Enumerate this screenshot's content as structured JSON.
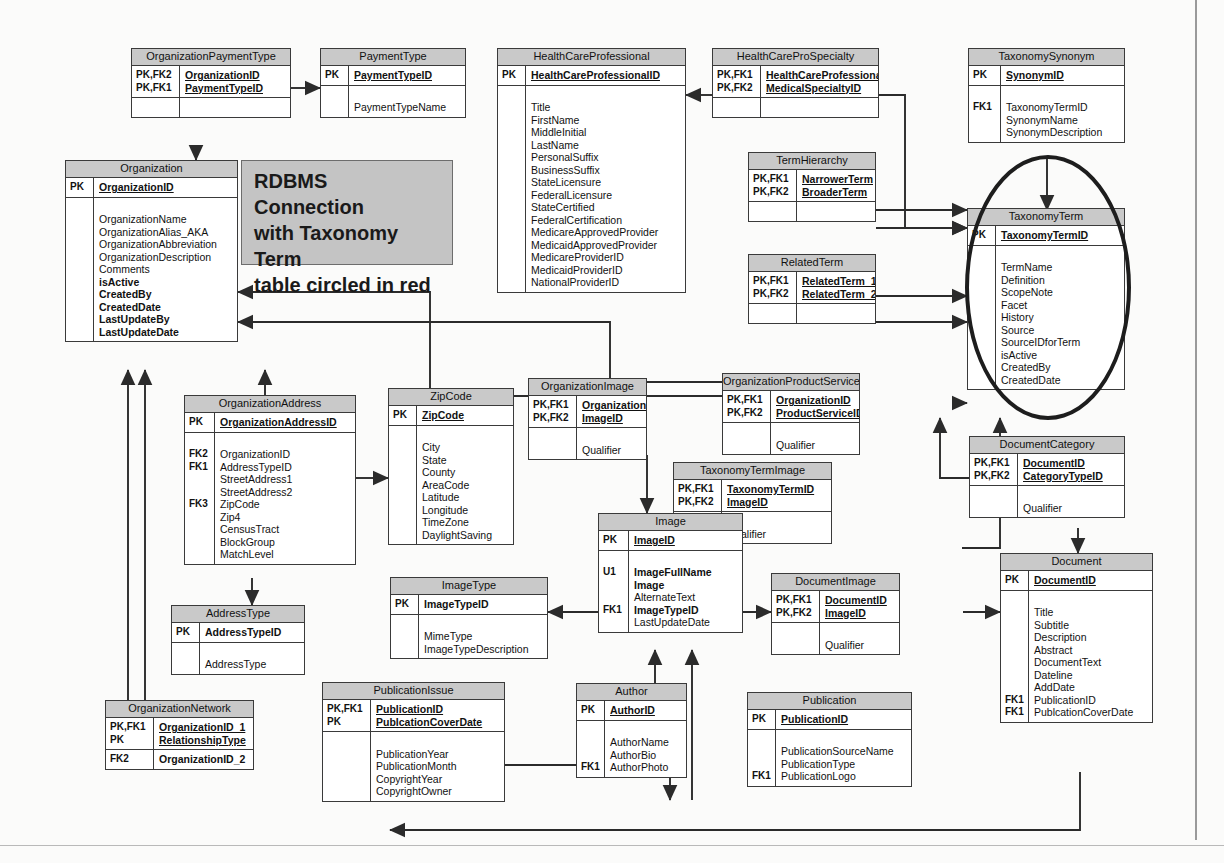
{
  "diagram": {
    "annotation": {
      "line1": "RDBMS Connection",
      "line2": "with Taxonomy Term",
      "line3": "table circled in red"
    },
    "highlight": {
      "target_table": "TaxonomyTerm",
      "shape": "ellipse",
      "color": "#cc0000",
      "rendered_color": "#1d1d1d"
    },
    "colors": {
      "table_header_fill": "#c9c9c9",
      "table_body_fill": "#ffffff",
      "table_border": "#3a3a3a",
      "connector": "#2b2b2b",
      "callout_fill": "#c4c4c4",
      "page_background": "#fbfbfa"
    },
    "tables": [
      {
        "id": "organization-payment-type",
        "name": "OrganizationPaymentType",
        "keys": [
          "PK,FK2",
          "PK,FK1"
        ],
        "pk_fields": [
          "OrganizationID",
          "PaymentTypeID"
        ],
        "attr_keys": [],
        "attributes": []
      },
      {
        "id": "payment-type",
        "name": "PaymentType",
        "keys": [
          "PK"
        ],
        "pk_fields": [
          "PaymentTypeID"
        ],
        "attr_keys": [],
        "attributes": [
          "PaymentTypeName"
        ]
      },
      {
        "id": "health-care-professional",
        "name": "HealthCareProfessional",
        "keys": [
          "PK"
        ],
        "pk_fields": [
          "HealthCareProfessionalID"
        ],
        "attr_keys": [],
        "attributes": [
          "Title",
          "FirstName",
          "MiddleInitial",
          "LastName",
          "PersonalSuffix",
          "BusinessSuffix",
          "StateLicensure",
          "FederalLicensure",
          "StateCertified",
          "FederalCertification",
          "MedicareApprovedProvider",
          "MedicaidApprovedProvider",
          "MedicareProviderID",
          "MedicaidProviderID",
          "NationalProviderID"
        ]
      },
      {
        "id": "health-care-pro-specialty",
        "name": "HealthCareProSpecialty",
        "keys": [
          "PK,FK1",
          "PK,FK2"
        ],
        "pk_fields": [
          "HealthCareProfessionalID",
          "MedicalSpecialtyID"
        ],
        "attr_keys": [],
        "attributes": []
      },
      {
        "id": "taxonomy-synonym",
        "name": "TaxonomySynonym",
        "keys": [
          "PK"
        ],
        "pk_fields": [
          "SynonymID"
        ],
        "attr_keys": [
          "FK1",
          "",
          ""
        ],
        "attributes": [
          "TaxonomyTermID",
          "SynonymName",
          "SynonymDescription"
        ]
      },
      {
        "id": "organization",
        "name": "Organization",
        "keys": [
          "PK"
        ],
        "pk_fields": [
          "OrganizationID"
        ],
        "attr_keys": [],
        "attributes": [
          "OrganizationName",
          "OrganizationAlias_AKA",
          "OrganizationAbbreviation",
          "OrganizationDescription",
          "Comments",
          "isActive",
          "CreatedBy",
          "CreatedDate",
          "LastUpdateBy",
          "LastUpdateDate"
        ],
        "bold_attributes": [
          "isActive",
          "CreatedBy",
          "CreatedDate",
          "LastUpdateBy",
          "LastUpdateDate"
        ]
      },
      {
        "id": "term-hierarchy",
        "name": "TermHierarchy",
        "keys": [
          "PK,FK1",
          "PK,FK2"
        ],
        "pk_fields": [
          "NarrowerTerm",
          "BroaderTerm"
        ],
        "attr_keys": [],
        "attributes": []
      },
      {
        "id": "related-term",
        "name": "RelatedTerm",
        "keys": [
          "PK,FK1",
          "PK,FK2"
        ],
        "pk_fields": [
          "RelatedTerm_1",
          "RelatedTerm_2"
        ],
        "attr_keys": [],
        "attributes": []
      },
      {
        "id": "taxonomy-term",
        "name": "TaxonomyTerm",
        "keys": [
          "PK"
        ],
        "pk_fields": [
          "TaxonomyTermID"
        ],
        "attr_keys": [],
        "attributes": [
          "TermName",
          "Definition",
          "ScopeNote",
          "Facet",
          "History",
          "Source",
          "SourceIDforTerm",
          "isActive",
          "CreatedBy",
          "CreatedDate"
        ]
      },
      {
        "id": "organization-address",
        "name": "OrganizationAddress",
        "keys": [
          "PK"
        ],
        "pk_fields": [
          "OrganizationAddressID"
        ],
        "attr_keys": [
          "FK2",
          "FK1",
          "",
          "",
          "FK3",
          "",
          "",
          "",
          ""
        ],
        "attributes": [
          "OrganizationID",
          "AddressTypeID",
          "StreetAddress1",
          "StreetAddress2",
          "ZipCode",
          "Zip4",
          "CensusTract",
          "BlockGroup",
          "MatchLevel"
        ]
      },
      {
        "id": "zip-code",
        "name": "ZipCode",
        "keys": [
          "PK"
        ],
        "pk_fields": [
          "ZipCode"
        ],
        "attr_keys": [],
        "attributes": [
          "City",
          "State",
          "County",
          "AreaCode",
          "Latitude",
          "Longitude",
          "TimeZone",
          "DaylightSaving"
        ]
      },
      {
        "id": "organization-image",
        "name": "OrganizationImage",
        "keys": [
          "PK,FK1",
          "PK,FK2"
        ],
        "pk_fields": [
          "OrganizationID",
          "ImageID"
        ],
        "attr_keys": [],
        "attributes": [
          "Qualifier"
        ]
      },
      {
        "id": "organization-product-service",
        "name": "OrganizationProductService",
        "keys": [
          "PK,FK1",
          "PK,FK2"
        ],
        "pk_fields": [
          "OrganizationID",
          "ProductServiceID"
        ],
        "attr_keys": [],
        "attributes": [
          "Qualifier"
        ]
      },
      {
        "id": "document-category",
        "name": "DocumentCategory",
        "keys": [
          "PK,FK1",
          "PK,FK2"
        ],
        "pk_fields": [
          "DocumentID",
          "CategoryTypeID"
        ],
        "attr_keys": [],
        "attributes": [
          "Qualifier"
        ]
      },
      {
        "id": "taxonomy-term-image",
        "name": "TaxonomyTermImage",
        "keys": [
          "PK,FK1",
          "PK,FK2"
        ],
        "pk_fields": [
          "TaxonomyTermID",
          "ImageID"
        ],
        "attr_keys": [],
        "attributes": [
          "Qualifier"
        ]
      },
      {
        "id": "image",
        "name": "Image",
        "keys": [
          "PK"
        ],
        "pk_fields": [
          "ImageID"
        ],
        "attr_keys": [
          "U1",
          "",
          "",
          "FK1",
          ""
        ],
        "attributes": [
          "ImageFullName",
          "Image",
          "AlternateText",
          "ImageTypeID",
          "LastUpdateDate"
        ],
        "bold_attributes": [
          "ImageFullName",
          "Image",
          "ImageTypeID"
        ]
      },
      {
        "id": "image-type",
        "name": "ImageType",
        "keys": [
          "PK"
        ],
        "pk_fields": [
          "ImageTypeID"
        ],
        "pk_underline": false,
        "attr_keys": [],
        "attributes": [
          "MimeType",
          "ImageTypeDescription"
        ]
      },
      {
        "id": "document-image",
        "name": "DocumentImage",
        "keys": [
          "PK,FK1",
          "PK,FK2"
        ],
        "pk_fields": [
          "DocumentID",
          "ImageID"
        ],
        "attr_keys": [],
        "attributes": [
          "Qualifier"
        ]
      },
      {
        "id": "document",
        "name": "Document",
        "keys": [
          "PK"
        ],
        "pk_fields": [
          "DocumentID"
        ],
        "attr_keys": [
          "",
          "",
          "",
          "",
          "",
          "",
          "",
          "FK1",
          "FK1"
        ],
        "attributes": [
          "Title",
          "Subtitle",
          "Description",
          "Abstract",
          "DocumentText",
          "Dateline",
          "AddDate",
          "PublicationID",
          "PublcationCoverDate"
        ]
      },
      {
        "id": "address-type",
        "name": "AddressType",
        "keys": [
          "PK"
        ],
        "pk_fields": [
          "AddressTypeID"
        ],
        "pk_underline": false,
        "attr_keys": [],
        "attributes": [
          "AddressType"
        ]
      },
      {
        "id": "organization-network",
        "name": "OrganizationNetwork",
        "keys": [
          "PK,FK1",
          "PK"
        ],
        "pk_fields": [
          "OrganizationID_1",
          "RelationshipType"
        ],
        "attr_keys": [
          "FK2"
        ],
        "attributes": [
          "OrganizationID_2"
        ],
        "bold_attributes": [
          "OrganizationID_2"
        ]
      },
      {
        "id": "publication-issue",
        "name": "PublicationIssue",
        "keys": [
          "PK,FK1",
          "PK"
        ],
        "pk_fields": [
          "PublicationID",
          "PublcationCoverDate"
        ],
        "attr_keys": [],
        "attributes": [
          "PublicationYear",
          "PublicationMonth",
          "CopyrightYear",
          "CopyrightOwner"
        ]
      },
      {
        "id": "author",
        "name": "Author",
        "keys": [
          "PK"
        ],
        "pk_fields": [
          "AuthorID"
        ],
        "attr_keys": [
          "",
          "",
          "FK1"
        ],
        "attributes": [
          "AuthorName",
          "AuthorBio",
          "AuthorPhoto"
        ]
      },
      {
        "id": "publication",
        "name": "Publication",
        "keys": [
          "PK"
        ],
        "pk_fields": [
          "PublicationID"
        ],
        "attr_keys": [
          "",
          "",
          "FK1"
        ],
        "attributes": [
          "PublicationSourceName",
          "PublicationType",
          "PublicationLogo"
        ]
      }
    ],
    "relationships": [
      {
        "from": "OrganizationPaymentType",
        "to": "PaymentType"
      },
      {
        "from": "OrganizationPaymentType",
        "to": "Organization"
      },
      {
        "from": "HealthCareProSpecialty",
        "to": "HealthCareProfessional"
      },
      {
        "from": "HealthCareProSpecialty",
        "to": "TaxonomyTerm"
      },
      {
        "from": "TaxonomySynonym",
        "to": "TaxonomyTerm"
      },
      {
        "from": "TermHierarchy",
        "to": "TaxonomyTerm"
      },
      {
        "from": "RelatedTerm",
        "to": "TaxonomyTerm"
      },
      {
        "from": "OrganizationProductService",
        "to": "TaxonomyTerm"
      },
      {
        "from": "OrganizationProductService",
        "to": "Organization"
      },
      {
        "from": "OrganizationAddress",
        "to": "ZipCode"
      },
      {
        "from": "OrganizationAddress",
        "to": "AddressType"
      },
      {
        "from": "OrganizationAddress",
        "to": "Organization"
      },
      {
        "from": "OrganizationImage",
        "to": "Image"
      },
      {
        "from": "TaxonomyTermImage",
        "to": "Image"
      },
      {
        "from": "TaxonomyTermImage",
        "to": "TaxonomyTerm"
      },
      {
        "from": "DocumentImage",
        "to": "Image"
      },
      {
        "from": "DocumentImage",
        "to": "Document"
      },
      {
        "from": "DocumentCategory",
        "to": "Document"
      },
      {
        "from": "DocumentCategory",
        "to": "TaxonomyTerm"
      },
      {
        "from": "Image",
        "to": "ImageType"
      },
      {
        "from": "Author",
        "to": "Image"
      },
      {
        "from": "Publication",
        "to": "Image"
      },
      {
        "from": "PublicationIssue",
        "to": "Publication"
      },
      {
        "from": "Document",
        "to": "PublicationIssue"
      },
      {
        "from": "OrganizationNetwork",
        "to": "Organization"
      }
    ]
  }
}
